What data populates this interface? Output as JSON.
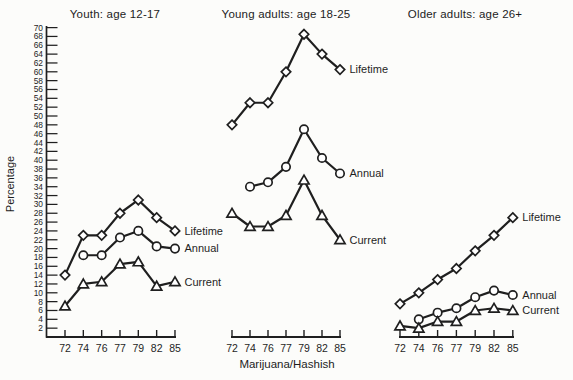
{
  "figure": {
    "y_axis_label": "Percentage",
    "x_axis_label": "Marijuana/Hashish",
    "ink_color": "#1f1f1f",
    "paper_color": "#fcfcfa"
  },
  "axis": {
    "y_min": 0,
    "y_max": 70,
    "y_tick_step": 2,
    "y_tick_labels_from": 2,
    "x_tick_labels": [
      "72",
      "74",
      "76",
      "77",
      "79",
      "82",
      "85"
    ]
  },
  "chart_data": [
    {
      "type": "line",
      "title": "Youth: age 12-17",
      "categories": [
        "72",
        "74",
        "76",
        "77",
        "79",
        "82",
        "85"
      ],
      "xlabel": "Marijuana/Hashish",
      "ylabel": "Percentage",
      "ylim": [
        0,
        70
      ],
      "grid": false,
      "legend_position": "right-of-last-point",
      "series": [
        {
          "name": "Lifetime",
          "marker": "diamond",
          "values": [
            14,
            23,
            23,
            28,
            31,
            27,
            24
          ]
        },
        {
          "name": "Annual",
          "marker": "circle",
          "values": [
            null,
            18.5,
            18.5,
            22.5,
            24,
            20.5,
            20
          ]
        },
        {
          "name": "Current",
          "marker": "triangle",
          "values": [
            7,
            12,
            12.5,
            16.5,
            17,
            11.5,
            12.5
          ]
        }
      ]
    },
    {
      "type": "line",
      "title": "Young adults: age 18-25",
      "categories": [
        "72",
        "74",
        "76",
        "77",
        "79",
        "82",
        "85"
      ],
      "xlabel": "Marijuana/Hashish",
      "ylabel": "Percentage",
      "ylim": [
        0,
        70
      ],
      "grid": false,
      "legend_position": "right-of-last-point",
      "series": [
        {
          "name": "Lifetime",
          "marker": "diamond",
          "values": [
            48,
            53,
            53,
            60,
            68.5,
            64,
            60.5
          ]
        },
        {
          "name": "Annual",
          "marker": "circle",
          "values": [
            null,
            34,
            35,
            38.5,
            47,
            40.5,
            37
          ]
        },
        {
          "name": "Current",
          "marker": "triangle",
          "values": [
            28,
            25,
            25,
            27.5,
            35.5,
            27.5,
            22
          ]
        }
      ]
    },
    {
      "type": "line",
      "title": "Older adults: age 26+",
      "categories": [
        "72",
        "74",
        "76",
        "77",
        "79",
        "82",
        "85"
      ],
      "xlabel": "Marijuana/Hashish",
      "ylabel": "Percentage",
      "ylim": [
        0,
        70
      ],
      "grid": false,
      "legend_position": "right-of-last-point",
      "series": [
        {
          "name": "Lifetime",
          "marker": "diamond",
          "values": [
            7.5,
            10,
            13,
            15.5,
            19.5,
            23,
            27
          ]
        },
        {
          "name": "Annual",
          "marker": "circle",
          "values": [
            null,
            4,
            5.5,
            6.5,
            9,
            10.5,
            9.5
          ]
        },
        {
          "name": "Current",
          "marker": "triangle",
          "values": [
            2.5,
            2,
            3.5,
            3.5,
            6,
            6.5,
            6
          ]
        }
      ]
    }
  ]
}
